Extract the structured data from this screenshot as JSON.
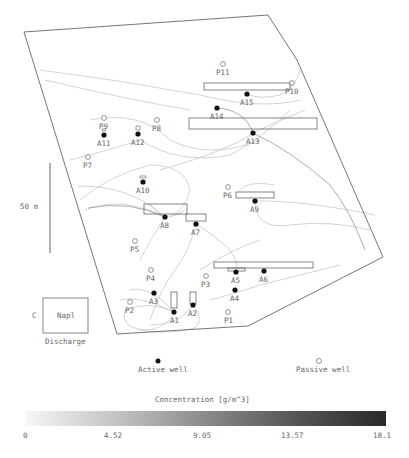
{
  "map": {
    "boundary": [
      [
        24,
        32
      ],
      [
        268,
        15
      ],
      [
        297,
        60
      ],
      [
        383,
        257
      ],
      [
        248,
        326
      ],
      [
        117,
        334
      ]
    ],
    "boundary_color": "#666666",
    "active_wells": [
      {
        "id": "A1",
        "x": 174,
        "y": 312,
        "lx": 170,
        "ly": 323
      },
      {
        "id": "A2",
        "x": 193,
        "y": 305,
        "lx": 188,
        "ly": 316
      },
      {
        "id": "A3",
        "x": 154,
        "y": 293,
        "lx": 149,
        "ly": 304
      },
      {
        "id": "A4",
        "x": 235,
        "y": 290,
        "lx": 230,
        "ly": 301
      },
      {
        "id": "A5",
        "x": 236,
        "y": 272,
        "lx": 231,
        "ly": 283
      },
      {
        "id": "A6",
        "x": 264,
        "y": 271,
        "lx": 259,
        "ly": 282
      },
      {
        "id": "A7",
        "x": 196,
        "y": 224,
        "lx": 191,
        "ly": 235
      },
      {
        "id": "A8",
        "x": 165,
        "y": 217,
        "lx": 160,
        "ly": 228
      },
      {
        "id": "A9",
        "x": 255,
        "y": 201,
        "lx": 250,
        "ly": 212
      },
      {
        "id": "A10",
        "x": 143,
        "y": 182,
        "lx": 136,
        "ly": 193
      },
      {
        "id": "A11",
        "x": 104,
        "y": 135,
        "lx": 97,
        "ly": 146
      },
      {
        "id": "A12",
        "x": 138,
        "y": 134,
        "lx": 131,
        "ly": 145
      },
      {
        "id": "A13",
        "x": 253,
        "y": 133,
        "lx": 246,
        "ly": 144
      },
      {
        "id": "A14",
        "x": 217,
        "y": 108,
        "lx": 210,
        "ly": 119
      },
      {
        "id": "A15",
        "x": 247,
        "y": 94,
        "lx": 240,
        "ly": 105
      }
    ],
    "passive_wells": [
      {
        "id": "P1",
        "x": 228,
        "y": 312,
        "lx": 224,
        "ly": 323
      },
      {
        "id": "P2",
        "x": 130,
        "y": 302,
        "lx": 125,
        "ly": 313
      },
      {
        "id": "P3",
        "x": 206,
        "y": 276,
        "lx": 201,
        "ly": 287
      },
      {
        "id": "P4",
        "x": 151,
        "y": 270,
        "lx": 146,
        "ly": 281
      },
      {
        "id": "P5",
        "x": 135,
        "y": 241,
        "lx": 130,
        "ly": 252
      },
      {
        "id": "P6",
        "x": 228,
        "y": 187,
        "lx": 223,
        "ly": 198
      },
      {
        "id": "P7",
        "x": 88,
        "y": 157,
        "lx": 83,
        "ly": 168
      },
      {
        "id": "P8",
        "x": 157,
        "y": 120,
        "lx": 152,
        "ly": 131
      },
      {
        "id": "P9",
        "x": 104,
        "y": 118,
        "lx": 99,
        "ly": 129
      },
      {
        "id": "P10",
        "x": 292,
        "y": 83,
        "lx": 285,
        "ly": 94
      },
      {
        "id": "P11",
        "x": 223,
        "y": 64,
        "lx": 216,
        "ly": 75
      }
    ],
    "screens": [
      {
        "x": 204,
        "y": 83,
        "w": 86,
        "h": 7
      },
      {
        "x": 189,
        "y": 118,
        "w": 128,
        "h": 11
      },
      {
        "x": 236,
        "y": 192,
        "w": 38,
        "h": 6
      },
      {
        "x": 144,
        "y": 204,
        "w": 43,
        "h": 10
      },
      {
        "x": 186,
        "y": 214,
        "w": 20,
        "h": 7
      },
      {
        "x": 214,
        "y": 262,
        "w": 99,
        "h": 6
      },
      {
        "x": 228,
        "y": 268,
        "w": 17,
        "h": 3
      },
      {
        "x": 171,
        "y": 292,
        "w": 6,
        "h": 16
      },
      {
        "x": 190,
        "y": 292,
        "w": 6,
        "h": 12
      }
    ],
    "small_markers": [
      {
        "x": 143,
        "y": 177,
        "w": 6,
        "h": 2
      },
      {
        "x": 104,
        "y": 130,
        "w": 3,
        "h": 2
      },
      {
        "x": 138,
        "y": 128,
        "w": 4,
        "h": 4
      }
    ]
  },
  "scale_bar": {
    "label": "50 m",
    "x": 50,
    "y1": 163,
    "y2": 253
  },
  "napl_box": {
    "label": "Napl",
    "side_label": "C",
    "caption": "Discharge"
  },
  "legend": {
    "active_label": "Active well",
    "passive_label": "Passive well"
  },
  "colorbar": {
    "title": "Concentration [g/m^3]",
    "ticks": [
      "0",
      "4.52",
      "9.05",
      "13.57",
      "18.1"
    ],
    "min_color": "#f7f7f7",
    "max_color": "#2a2a2a"
  }
}
